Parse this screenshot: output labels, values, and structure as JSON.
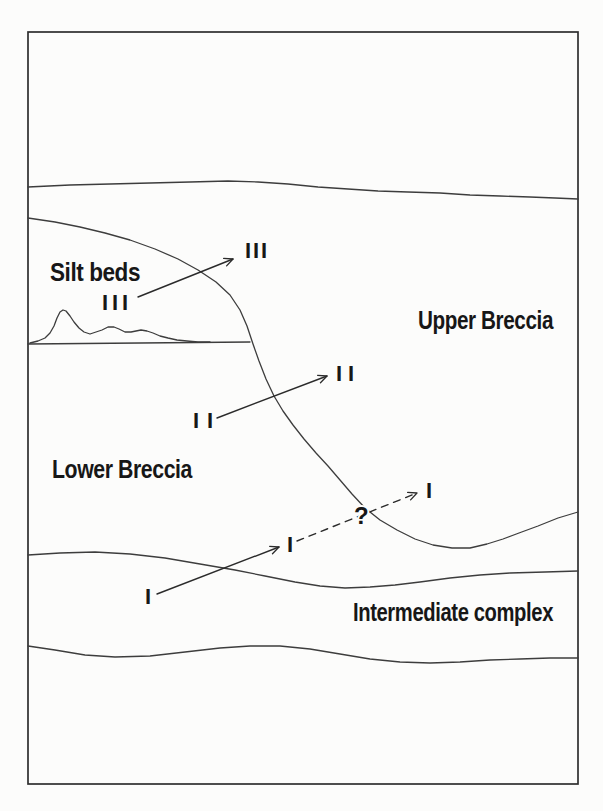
{
  "figure": {
    "kind": "geological-cross-section-sketch",
    "labels": {
      "silt_beds": "Silt beds",
      "upper_breccia": "Upper Breccia",
      "lower_breccia": "Lower Breccia",
      "intermediate_complex": "Intermediate complex"
    },
    "unit_markers": {
      "iii_source": "III",
      "iii_target": "III",
      "ii_source": "II",
      "ii_target": "II",
      "i_source": "I",
      "i_target": "I",
      "i_dashed_target": "I",
      "query": "?"
    },
    "colors": {
      "background": "#fcfcfb",
      "ink": "#171717",
      "line": "#3d3d3d",
      "frame": "#2e2e2e"
    }
  }
}
